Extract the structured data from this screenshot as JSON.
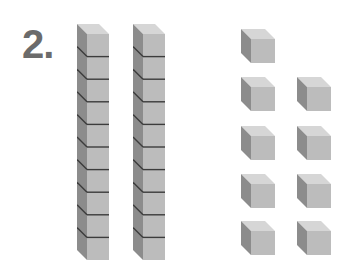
{
  "problem": {
    "number_label": "2.",
    "tens_rods": 2,
    "cubes_per_rod": 10,
    "unit_cubes": 9,
    "represented_value": 29
  },
  "layout": {
    "rods": [
      {
        "x": 77,
        "y": 24
      },
      {
        "x": 133,
        "y": 24
      }
    ],
    "units": [
      {
        "x": 241,
        "y": 29
      },
      {
        "x": 241,
        "y": 77
      },
      {
        "x": 297,
        "y": 77
      },
      {
        "x": 241,
        "y": 126
      },
      {
        "x": 297,
        "y": 126
      },
      {
        "x": 241,
        "y": 174
      },
      {
        "x": 297,
        "y": 174
      },
      {
        "x": 241,
        "y": 221
      },
      {
        "x": 297,
        "y": 221
      }
    ]
  },
  "colors": {
    "text": "#6b6b6b",
    "top_face": "#d6d6d6",
    "side_face": "#8c8c8c",
    "front_face": "#bcbcbc",
    "divider": "#3c3c3c"
  }
}
